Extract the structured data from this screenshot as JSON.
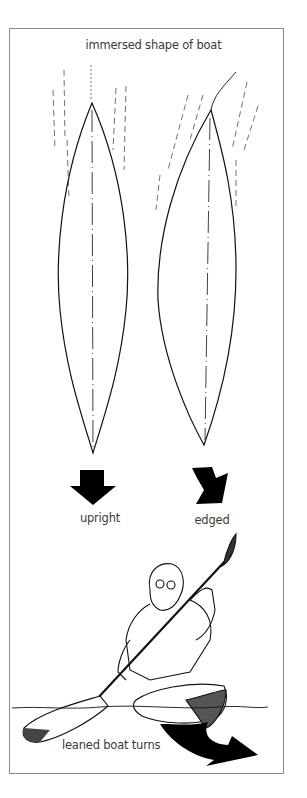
{
  "diagram": {
    "title": "immersed shape of boat",
    "panels": [
      {
        "id": "upright",
        "label": "upright",
        "arrow": "straight-down-arrow"
      },
      {
        "id": "edged",
        "label": "edged",
        "arrow": "skewed-arrow"
      }
    ],
    "illustration": {
      "subject": "kayaker leaning boat with paddle",
      "caption": "leaned boat turns",
      "arrow": "curved-turn-arrow"
    },
    "colors": {
      "ink": "#111111",
      "text": "#3a3a3a",
      "frame": "#8a8a8a",
      "background": "#ffffff"
    }
  }
}
